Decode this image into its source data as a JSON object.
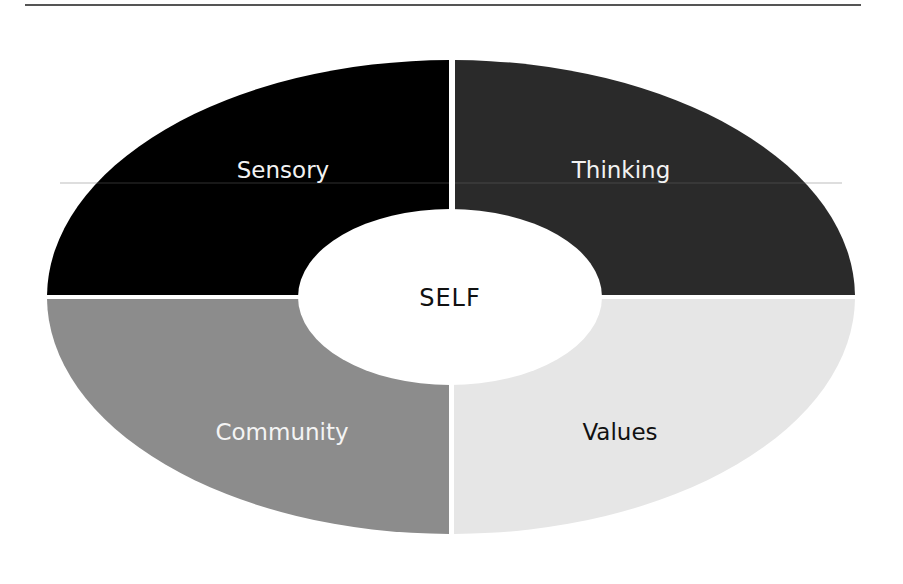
{
  "diagram": {
    "center": {
      "label": "SELF",
      "fill": "#ffffff",
      "text_color": "#111111"
    },
    "segments": [
      {
        "id": "sensory",
        "label": "Sensory",
        "position": "top-left",
        "fill": "#000000",
        "text_color": "#f2f2f2"
      },
      {
        "id": "thinking",
        "label": "Thinking",
        "position": "top-right",
        "fill": "#2a2a2a",
        "text_color": "#f2f2f2"
      },
      {
        "id": "community",
        "label": "Community",
        "position": "bottom-left",
        "fill": "#8c8c8c",
        "text_color": "#f4f4f4"
      },
      {
        "id": "values",
        "label": "Values",
        "position": "bottom-right",
        "fill": "#e6e6e6",
        "text_color": "#111111"
      }
    ]
  }
}
